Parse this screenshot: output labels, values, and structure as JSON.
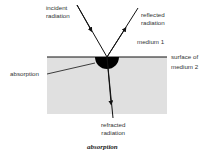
{
  "diagram": {
    "labels": {
      "incident_line1": "incident",
      "incident_line2": "radiation",
      "reflected_line1": "reflected",
      "reflected_line2": "radiation",
      "medium1": "medium 1",
      "surface_line1": "surface of",
      "surface_line2": "medium 2",
      "absorption": "absorption",
      "refracted_line1": "refracted",
      "refracted_line2": "radiation"
    },
    "caption": "absorption",
    "colors": {
      "medium2_fill": "#e0e0e0",
      "lines": "#111111",
      "absorption_fill": "#000000"
    }
  }
}
